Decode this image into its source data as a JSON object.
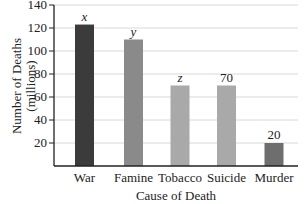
{
  "chart_data": {
    "type": "bar",
    "title": "",
    "xlabel": "Cause of Death",
    "ylabel": "Number of Deaths",
    "ylabel_sub": "(millions)",
    "ylim": [
      0,
      140
    ],
    "yticks": [
      20,
      40,
      60,
      80,
      100,
      120,
      140
    ],
    "grid": true,
    "legend": null,
    "categories": [
      "War",
      "Famine",
      "Tobacco",
      "Suicide",
      "Murder"
    ],
    "values": [
      123,
      110,
      70,
      70,
      20
    ],
    "bar_labels": [
      "x",
      "y",
      "z",
      "70",
      "20"
    ],
    "bar_colors": [
      "#3b3b3b",
      "#8a8a8a",
      "#a9a9a9",
      "#a9a9a9",
      "#6e6e6e"
    ]
  },
  "colors": {
    "axis": "#222222",
    "grid": "#d8d8d8",
    "background": "#ffffff"
  }
}
